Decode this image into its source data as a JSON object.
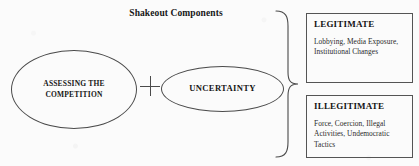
{
  "diagram": {
    "title": "Shakeout Components",
    "nodes": {
      "left_ellipse": {
        "line1": "ASSESSING THE",
        "line2": "COMPETITION"
      },
      "operator": "+",
      "right_ellipse": {
        "label": "UNCERTAINTY"
      }
    },
    "outcomes": [
      {
        "title": "LEGITIMATE",
        "body": "Lobbying, Media Exposure, Institutional Changes"
      },
      {
        "title": "ILLEGITIMATE",
        "body": "Force, Coercion, Illegal Activities, Undemocratic Tactics"
      }
    ],
    "colors": {
      "background": "#fbfbfb",
      "line": "#4a4a4a",
      "box_border": "#545454",
      "text": "#1c1c1c"
    }
  }
}
